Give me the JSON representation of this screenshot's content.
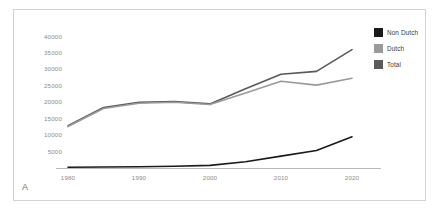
{
  "panel": {
    "label": "A"
  },
  "colors": {
    "non_dutch": "#1a1a1a",
    "dutch": "#9a9a9a",
    "total": "#5a5a5a",
    "axis": "#b9b9b9",
    "frame": "#d3d3d3",
    "tick_text": "#8c8c8c",
    "legend_text": "#3a3a3a",
    "background": "#ffffff"
  },
  "legend": {
    "position": "top-right",
    "items": [
      {
        "label": "Non Dutch",
        "color": "#1a1a1a"
      },
      {
        "label": "Dutch",
        "color": "#9a9a9a"
      },
      {
        "label": "Total",
        "color": "#5a5a5a"
      }
    ]
  },
  "axes": {
    "y_ticks": [
      "40000",
      "35000",
      "30000",
      "25000",
      "20000",
      "15000",
      "10000",
      "5000"
    ],
    "x_ticks": [
      "1980",
      "1990",
      "2000",
      "2010",
      "2020"
    ]
  },
  "chart_data": {
    "type": "line",
    "title": "",
    "xlabel": "",
    "ylabel": "",
    "xlim": [
      1980,
      2020
    ],
    "ylim": [
      0,
      42000
    ],
    "grid": false,
    "legend_position": "top-right",
    "x": [
      1980,
      1985,
      1990,
      1995,
      2000,
      2005,
      2010,
      2015,
      2020
    ],
    "series": [
      {
        "name": "Non Dutch",
        "color": "#1a1a1a",
        "values": [
          250,
          300,
          400,
          550,
          800,
          1900,
          3600,
          5300,
          9500
        ]
      },
      {
        "name": "Dutch",
        "color": "#9a9a9a",
        "values": [
          12600,
          18100,
          19700,
          20000,
          19300,
          22800,
          26400,
          25200,
          27300
        ]
      },
      {
        "name": "Total",
        "color": "#5a5a5a",
        "values": [
          12850,
          18400,
          20000,
          20200,
          19500,
          24100,
          28500,
          29400,
          36000
        ]
      }
    ]
  }
}
